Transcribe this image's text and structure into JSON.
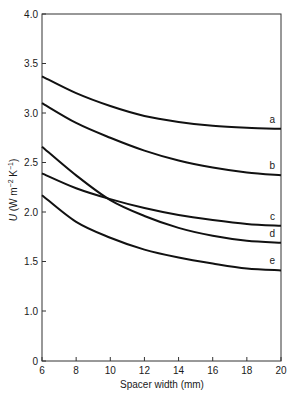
{
  "chart_data": {
    "type": "line",
    "title": "",
    "xlabel": "Spacer width (mm)",
    "ylabel": "U (W m-2 K-1)",
    "ylabel_parts": {
      "italic": "U",
      "rest": " (W m",
      "sup1": "−2",
      "mid": " K",
      "sup2": "−1",
      "end": ")"
    },
    "xlim": [
      6,
      20
    ],
    "ylim": [
      0,
      4.0
    ],
    "y_axis_break": "between 0 and 1.0",
    "x_ticks": [
      6,
      8,
      10,
      12,
      14,
      16,
      18,
      20
    ],
    "y_ticks": [
      "0",
      "1.0",
      "1.5",
      "2.0",
      "2.5",
      "3.0",
      "3.5",
      "4.0"
    ],
    "grid": false,
    "legend": "curve labels at right end",
    "x": [
      6,
      8,
      10,
      12,
      14,
      16,
      18,
      20
    ],
    "series": [
      {
        "name": "a",
        "values": [
          3.37,
          3.2,
          3.07,
          2.97,
          2.91,
          2.87,
          2.85,
          2.84
        ]
      },
      {
        "name": "b",
        "values": [
          3.1,
          2.9,
          2.75,
          2.62,
          2.52,
          2.45,
          2.4,
          2.37
        ]
      },
      {
        "name": "c",
        "values": [
          2.39,
          2.24,
          2.13,
          2.04,
          1.97,
          1.92,
          1.88,
          1.86
        ]
      },
      {
        "name": "d",
        "values": [
          2.66,
          2.37,
          2.12,
          1.96,
          1.84,
          1.76,
          1.71,
          1.69
        ]
      },
      {
        "name": "e",
        "values": [
          2.17,
          1.9,
          1.74,
          1.62,
          1.54,
          1.48,
          1.43,
          1.41
        ]
      }
    ]
  }
}
